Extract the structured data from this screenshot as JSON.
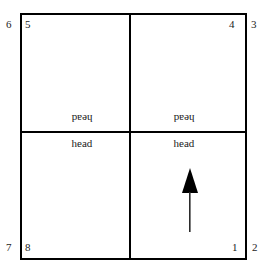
{
  "diagram": {
    "frame": {
      "name": "outer-rectangle",
      "border_color": "#000000"
    },
    "dividers": {
      "vertical": "vertical-center-divider",
      "horizontal": "horizontal-center-divider"
    },
    "corner_numbers": {
      "top_left_outside": "6",
      "top_left_inside": "5",
      "top_right_inside": "4",
      "top_right_outside": "3",
      "bottom_left_outside": "7",
      "bottom_left_inside": "8",
      "bottom_right_inside": "1",
      "bottom_right_outside": "2"
    },
    "labels": {
      "head_upper_left": "head",
      "head_lower_left": "head",
      "head_upper_right": "head",
      "head_lower_right": "head"
    },
    "arrow": {
      "name": "up-arrow",
      "direction": "up",
      "color": "#000000"
    },
    "colors": {
      "background": "#ffffff",
      "ink": "#000000",
      "text": "#1a1a1a"
    }
  }
}
